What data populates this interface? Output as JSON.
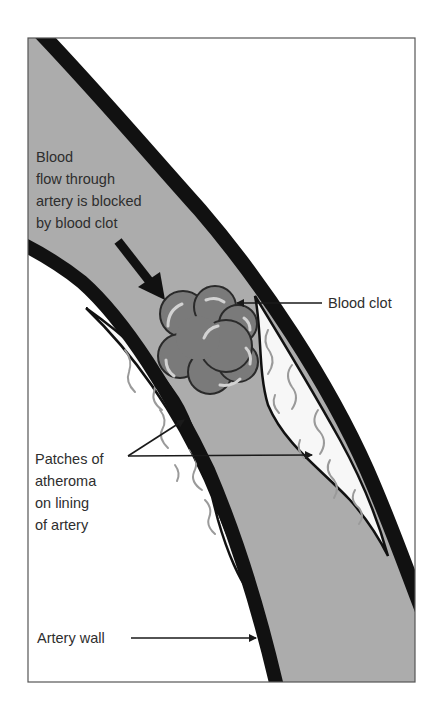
{
  "diagram": {
    "colors": {
      "background": "#ffffff",
      "frame": "#555555",
      "artery_wall": "#111111",
      "blood_lumen": "#acacac",
      "atheroma_fill": "#f7f7f7",
      "atheroma_streaks": "#9a9a9a",
      "clot_fill": "#7a7a7a",
      "clot_outline": "#2a2a2a",
      "clot_highlight": "#d2d2d2",
      "text": "#2e2e2e"
    },
    "labels": {
      "blood_flow": {
        "lines": [
          "Blood",
          "flow through",
          "artery is blocked",
          "by blood clot"
        ]
      },
      "blood_clot": {
        "text": "Blood clot"
      },
      "atheroma": {
        "lines": [
          "Patches of",
          "atheroma",
          "on lining",
          "of artery"
        ]
      },
      "artery_wall": {
        "text": "Artery wall"
      }
    }
  }
}
